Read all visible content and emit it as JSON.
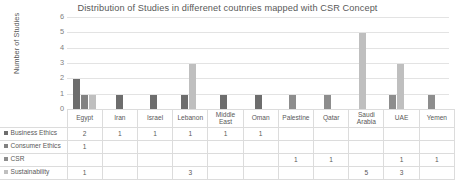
{
  "chart_data": {
    "type": "bar",
    "title": "Distribution of Studies in differenet coutnries mapped with CSR Concept",
    "xlabel": "",
    "ylabel": "Number of Studies",
    "ylim": [
      0,
      6
    ],
    "yticks": [
      0,
      1,
      2,
      3,
      4,
      5,
      6
    ],
    "grid": true,
    "legend_position": "data-table-left",
    "categories": [
      "Egypt",
      "Iran",
      "Israel",
      "Lebanon",
      "Middle East",
      "Oman",
      "Palestine",
      "Qatar",
      "Saudi Arabia",
      "UAE",
      "Yemen"
    ],
    "series": [
      {
        "name": "Business Ethics",
        "color": "#6d6d6d",
        "values": [
          2,
          1,
          1,
          1,
          1,
          1,
          null,
          null,
          null,
          null,
          null
        ]
      },
      {
        "name": "Consumer Ethics",
        "color": "#828282",
        "values": [
          1,
          null,
          null,
          null,
          null,
          null,
          null,
          null,
          null,
          null,
          null
        ]
      },
      {
        "name": "CSR",
        "color": "#8d8d8d",
        "values": [
          null,
          null,
          null,
          null,
          null,
          null,
          1,
          1,
          null,
          1,
          1
        ]
      },
      {
        "name": "Sustainability",
        "color": "#bfbfbf",
        "values": [
          1,
          null,
          null,
          3,
          null,
          null,
          null,
          null,
          5,
          3,
          null
        ]
      }
    ]
  }
}
